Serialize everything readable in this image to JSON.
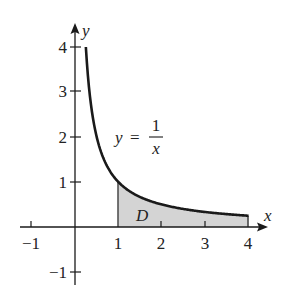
{
  "diagram": {
    "axes": {
      "x_label": "x",
      "y_label": "y",
      "x_ticks": [
        {
          "value": -1,
          "label": "−1"
        },
        {
          "value": 1,
          "label": "1"
        },
        {
          "value": 2,
          "label": "2"
        },
        {
          "value": 3,
          "label": "3"
        },
        {
          "value": 4,
          "label": "4"
        }
      ],
      "y_ticks": [
        {
          "value": 4,
          "label": "4"
        },
        {
          "value": 3,
          "label": "3"
        },
        {
          "value": 2,
          "label": "2"
        },
        {
          "value": 1,
          "label": "1"
        },
        {
          "value": -1,
          "label": "−1"
        }
      ]
    },
    "curve": {
      "equation_lhs": "y",
      "equation_eq": "=",
      "equation_num": "1",
      "equation_den": "x",
      "function": "1/x",
      "domain": [
        0.25,
        4
      ]
    },
    "region": {
      "label": "D",
      "x_from": 1,
      "x_to": 4,
      "fill_color": "#d4d4d4"
    },
    "colors": {
      "stroke": "#1a1a1a",
      "fill": "#d4d4d4",
      "background": "#ffffff"
    }
  }
}
